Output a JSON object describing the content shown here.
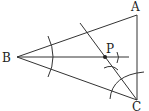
{
  "diagram": {
    "type": "geometric-construction",
    "points": {
      "A": {
        "label": "A",
        "x": 137,
        "y": 15
      },
      "B": {
        "label": "B",
        "x": 17,
        "y": 57
      },
      "C": {
        "label": "C",
        "x": 137,
        "y": 100
      },
      "P": {
        "label": "P",
        "x": 105,
        "y": 57
      }
    },
    "segments": [
      "AB",
      "BC",
      "AC"
    ],
    "constructions": [
      "angle bisector of angle B (ray from B through P)",
      "angle bisector of angle C (line from C through P)",
      "compass arcs near B, near P, and around C"
    ],
    "colors": {
      "stroke": "#333333",
      "label": "#222222",
      "background": "#ffffff"
    }
  }
}
